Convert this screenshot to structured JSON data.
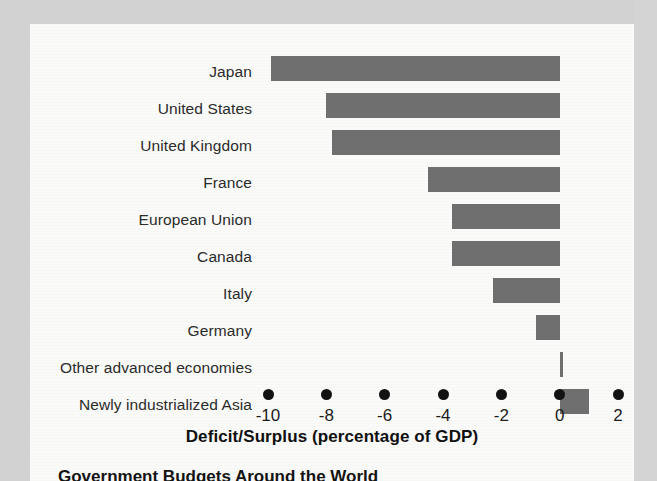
{
  "chart_data": {
    "type": "bar",
    "orientation": "horizontal",
    "title": "",
    "xlabel": "Deficit/Surplus (percentage of GDP)",
    "ylabel": "",
    "xlim": [
      -11,
      2.6
    ],
    "xticks": [
      -10,
      -8,
      -6,
      -4,
      -2,
      0,
      2
    ],
    "xtick_labels": [
      "-10",
      "-8",
      "-6",
      "-4",
      "-2",
      "0",
      "2"
    ],
    "grid": false,
    "legend": null,
    "bar_color": "#6f6f6f",
    "categories": [
      "Japan",
      "United States",
      "United Kingdom",
      "France",
      "European Union",
      "Canada",
      "Italy",
      "Germany",
      "Other advanced economies",
      "Newly industrialized Asia"
    ],
    "values": [
      -9.9,
      -8.0,
      -7.8,
      -4.5,
      -3.7,
      -3.7,
      -2.3,
      -0.8,
      0.1,
      1.0
    ]
  },
  "axis": {
    "title": "Deficit/Surplus (percentage of GDP)"
  },
  "caption": {
    "text": "Government Budgets Around the World"
  }
}
